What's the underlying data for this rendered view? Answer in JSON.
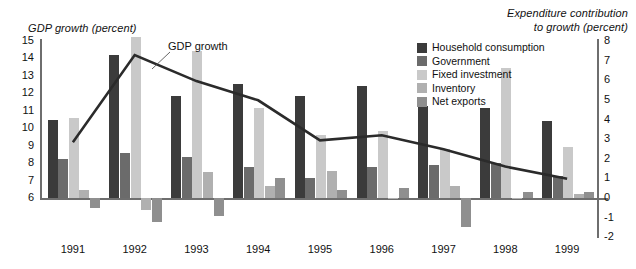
{
  "axes": {
    "left_title": "GDP growth (percent)",
    "right_title_line1": "Expenditure contribution",
    "right_title_line2": "to growth (percent)",
    "left_ticks": [
      "15",
      "14",
      "13",
      "12",
      "11",
      "10",
      "9",
      "8",
      "7",
      "6"
    ],
    "right_ticks": [
      "8",
      "7",
      "6",
      "5",
      "4",
      "3",
      "2",
      "1",
      "0",
      "-1",
      "-2"
    ]
  },
  "line_label": "GDP growth",
  "legend": {
    "items": [
      {
        "label": "Household consumption",
        "color": "#3b3b3b"
      },
      {
        "label": "Government",
        "color": "#6b6b6b"
      },
      {
        "label": "Fixed investment",
        "color": "#c9c9c9"
      },
      {
        "label": "Inventory",
        "color": "#b0b0b0"
      },
      {
        "label": "Net exports",
        "color": "#8f8f8f"
      }
    ]
  },
  "chart_data": {
    "type": "bar",
    "title": "",
    "xlabel": "",
    "ylabel": "GDP growth (percent)",
    "y2label": "Expenditure contribution to growth (percent)",
    "grid": false,
    "legend_position": "top-right",
    "categories": [
      "1991",
      "1992",
      "1993",
      "1994",
      "1995",
      "1996",
      "1997",
      "1998",
      "1999"
    ],
    "ylim": [
      6,
      15
    ],
    "y2lim": [
      -2,
      8
    ],
    "series": [
      {
        "name": "Household consumption",
        "color": "#3b3b3b",
        "axis": "y2",
        "values": [
          4.0,
          7.3,
          5.2,
          5.8,
          5.2,
          5.7,
          4.7,
          4.6,
          3.9
        ]
      },
      {
        "name": "Government",
        "color": "#6b6b6b",
        "axis": "y2",
        "values": [
          2.0,
          2.3,
          2.1,
          1.6,
          1.0,
          1.6,
          1.7,
          1.8,
          1.1
        ]
      },
      {
        "name": "Fixed investment",
        "color": "#c9c9c9",
        "axis": "y2",
        "values": [
          4.1,
          8.2,
          7.5,
          4.6,
          3.2,
          3.4,
          2.5,
          6.6,
          2.6
        ]
      },
      {
        "name": "Inventory",
        "color": "#b0b0b0",
        "axis": "y2",
        "values": [
          0.4,
          -0.6,
          1.3,
          0.6,
          1.4,
          0.0,
          0.6,
          0.0,
          0.2
        ]
      },
      {
        "name": "Net exports",
        "color": "#8f8f8f",
        "axis": "y2",
        "values": [
          -0.5,
          -1.2,
          -0.9,
          1.0,
          0.4,
          0.5,
          -1.5,
          0.3,
          0.3
        ]
      }
    ],
    "line_series": {
      "name": "GDP growth",
      "color": "#2b2b2b",
      "axis": "y",
      "values": [
        9.2,
        14.2,
        12.7,
        11.6,
        9.3,
        9.6,
        8.8,
        7.8,
        7.1
      ]
    }
  }
}
